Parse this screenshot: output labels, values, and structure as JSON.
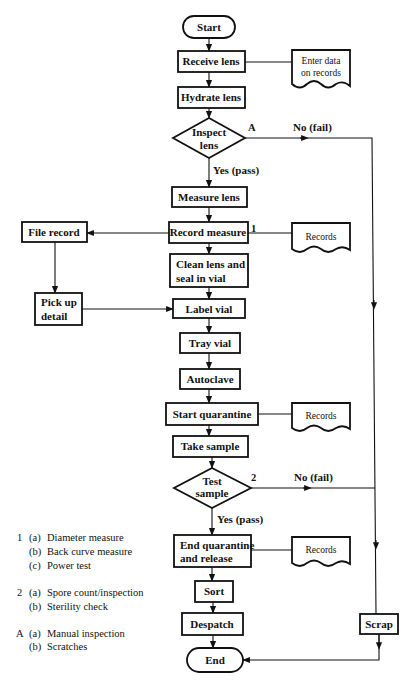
{
  "flowchart": {
    "start": "Start",
    "end": "End",
    "steps": {
      "receive_lens": "Receive lens",
      "hydrate_lens": "Hydrate lens",
      "measure_lens": "Measure lens",
      "record_measure": "Record measure",
      "clean_lens_1": "Clean lens and",
      "clean_lens_2": "seal in vial",
      "label_vial": "Label vial",
      "tray_vial": "Tray vial",
      "autoclave": "Autoclave",
      "start_quarantine": "Start quarantine",
      "take_sample": "Take sample",
      "end_quarantine_1": "End quarantine",
      "end_quarantine_2": "and release",
      "sort": "Sort",
      "despatch": "Despatch",
      "file_record": "File record",
      "pick_up_1": "Pick up",
      "pick_up_2": "detail",
      "scrap": "Scrap"
    },
    "decisions": {
      "inspect_1": "Inspect",
      "inspect_2": "lens",
      "inspect_tag": "A",
      "test_1": "Test",
      "test_2": "sample",
      "test_tag": "2"
    },
    "branch_labels": {
      "inspect_no": "No (fail)",
      "inspect_yes": "Yes (pass)",
      "test_no": "No (fail)",
      "test_yes": "Yes (pass)"
    },
    "documents": {
      "enter_data_1": "Enter data",
      "enter_data_2": "on records",
      "records_1": "Records",
      "records_2": "Records",
      "records_3": "Records"
    },
    "record_measure_tag": "1"
  },
  "notes": [
    {
      "key": "1",
      "items": [
        {
          "sub": "(a)",
          "text": "Diameter measure"
        },
        {
          "sub": "(b)",
          "text": "Back curve measure"
        },
        {
          "sub": "(c)",
          "text": "Power test"
        }
      ]
    },
    {
      "key": "2",
      "items": [
        {
          "sub": "(a)",
          "text": "Spore count/inspection"
        },
        {
          "sub": "(b)",
          "text": "Sterility check"
        }
      ]
    },
    {
      "key": "A",
      "items": [
        {
          "sub": "(a)",
          "text": "Manual inspection"
        },
        {
          "sub": "(b)",
          "text": "Scratches"
        }
      ]
    }
  ]
}
